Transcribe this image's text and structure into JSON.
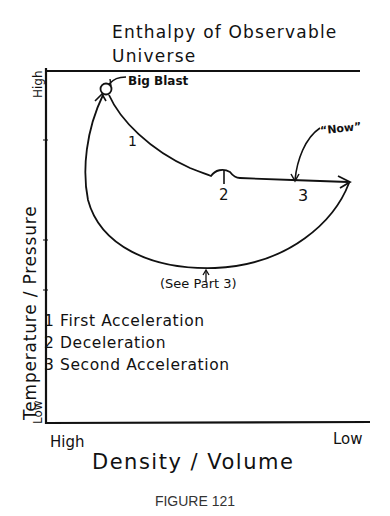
{
  "diagram": {
    "title_line1": "Enthalpy of Observable",
    "title_line2": "Universe",
    "y_axis": {
      "label": "Temperature / Pressure",
      "high": "High",
      "low": "Low"
    },
    "x_axis": {
      "label": "Density / Volume",
      "high": "High",
      "low": "Low"
    },
    "annotations": {
      "big_blast": "Big Blast",
      "now": "“Now”",
      "see_part": "(See Part 3)",
      "point_1": "1",
      "point_2": "2",
      "point_3": "3"
    },
    "legend": [
      {
        "num": "1",
        "text": "First Acceleration",
        "line": "1 First Acceleration"
      },
      {
        "num": "2",
        "text": "Deceleration",
        "line": "2 Deceleration"
      },
      {
        "num": "3",
        "text": "Second Acceleration",
        "line": "3 Second Acceleration"
      }
    ],
    "caption": "FIGURE 121",
    "line_color": "#111111"
  }
}
